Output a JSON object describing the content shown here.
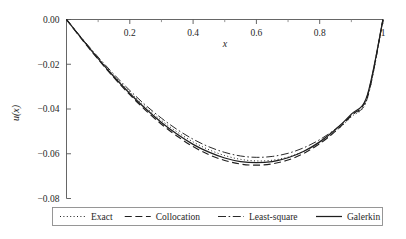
{
  "chart_data": {
    "type": "line",
    "title": "",
    "xlabel": "x",
    "ylabel": "u(x)",
    "xlim": [
      0,
      1
    ],
    "ylim": [
      -0.08,
      0.0
    ],
    "grid": false,
    "x_axis_position": "top",
    "y_axis_position": "left",
    "legend_position": "bottom-outside",
    "xticks": [
      0.2,
      0.4,
      0.6,
      0.8,
      1
    ],
    "xtick_labels": [
      "0.2",
      "0.4",
      "0.6",
      "0.8",
      "1"
    ],
    "xticks_minor": [
      0.1,
      0.3,
      0.5,
      0.7,
      0.9
    ],
    "yticks": [
      0.0,
      -0.02,
      -0.04,
      -0.06,
      -0.08
    ],
    "ytick_labels": [
      "0.00",
      "−0.02",
      "−0.04",
      "−0.06",
      "−0.08"
    ],
    "x": [
      0,
      0.05,
      0.1,
      0.15,
      0.2,
      0.25,
      0.3,
      0.35,
      0.4,
      0.45,
      0.5,
      0.55,
      0.6,
      0.65,
      0.7,
      0.75,
      0.8,
      0.85,
      0.9,
      0.95,
      1
    ],
    "series": [
      {
        "name": "Exact",
        "style": "dotted",
        "color": "#1f1f1f",
        "values": [
          0,
          -0.0088,
          -0.0172,
          -0.0251,
          -0.0324,
          -0.0391,
          -0.0451,
          -0.0503,
          -0.0547,
          -0.0582,
          -0.0608,
          -0.0625,
          -0.0632,
          -0.0629,
          -0.0615,
          -0.0589,
          -0.0551,
          -0.05,
          -0.0435,
          -0.0355,
          0
        ]
      },
      {
        "name": "Collocation",
        "style": "dashed",
        "color": "#1f1f1f",
        "values": [
          0,
          -0.0091,
          -0.0178,
          -0.026,
          -0.0336,
          -0.0406,
          -0.0468,
          -0.0522,
          -0.0568,
          -0.0604,
          -0.063,
          -0.0646,
          -0.0651,
          -0.0645,
          -0.0628,
          -0.0598,
          -0.0555,
          -0.0499,
          -0.0429,
          -0.0344,
          0
        ]
      },
      {
        "name": "Least-square",
        "style": "dashdot",
        "color": "#1f1f1f",
        "values": [
          0,
          -0.0086,
          -0.0168,
          -0.0245,
          -0.0317,
          -0.0383,
          -0.0441,
          -0.0492,
          -0.0535,
          -0.0569,
          -0.0594,
          -0.061,
          -0.0616,
          -0.0612,
          -0.0598,
          -0.0573,
          -0.0537,
          -0.0489,
          -0.0428,
          -0.0354,
          0
        ]
      },
      {
        "name": "Galerkin",
        "style": "solid",
        "color": "#1f1f1f",
        "values": [
          0,
          -0.0089,
          -0.0175,
          -0.0256,
          -0.0331,
          -0.0399,
          -0.046,
          -0.0513,
          -0.0558,
          -0.0593,
          -0.0619,
          -0.0635,
          -0.064,
          -0.0635,
          -0.0618,
          -0.0589,
          -0.0547,
          -0.0492,
          -0.0423,
          -0.034,
          0
        ]
      }
    ],
    "minimum_annotations": {
      "exact_min": -0.0632,
      "collocation_min": -0.0651,
      "least_square_min": -0.0616,
      "galerkin_min": -0.064,
      "min_location_x": 0.6
    }
  },
  "legend": {
    "entries": [
      {
        "label": "Exact",
        "style": "dotted"
      },
      {
        "label": "Collocation",
        "style": "dashed"
      },
      {
        "label": "Least-square",
        "style": "dashdot"
      },
      {
        "label": "Galerkin",
        "style": "solid"
      }
    ]
  }
}
